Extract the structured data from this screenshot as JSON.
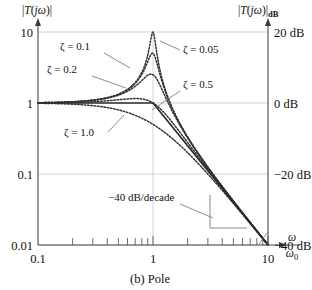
{
  "figure": {
    "caption": "(b) Pole",
    "left_axis_title": "|T(jω)|",
    "right_axis_title_main": "|T(jω)|",
    "right_axis_title_sub": "dB",
    "x_axis_title_num": "ω",
    "x_axis_title_den": "ω",
    "x_axis_title_den_sub": "0"
  },
  "chart_data": {
    "type": "line",
    "title": "(b) Pole",
    "xlabel": "ω/ω0",
    "ylabel": "|T(jω)|",
    "ylabel_right": "|T(jω)|dB",
    "xscale": "log",
    "yscale": "log",
    "xlim": [
      0.1,
      10
    ],
    "ylim": [
      0.01,
      10
    ],
    "grid": true,
    "legend_position": "inline-annotations",
    "x_ticks": [
      "0.1",
      "1",
      "10"
    ],
    "x_tick_values": [
      0.1,
      1,
      10
    ],
    "y_ticks_left": [
      "10",
      "1",
      "0.1",
      "0.01"
    ],
    "y_tick_values": [
      10,
      1,
      0.1,
      0.01
    ],
    "y_ticks_right": [
      "20 dB",
      "0 dB",
      "−20 dB",
      "−40 dB"
    ],
    "y_tick_values_right": [
      20,
      0,
      -20,
      -40
    ],
    "annotations": [
      {
        "text": "−40 dB/decade",
        "x": 1.9,
        "y": 0.055
      }
    ],
    "series": [
      {
        "name": "ζ = 0.05",
        "label": "ζ = 0.05",
        "zeta": 0.05,
        "style": "dotted",
        "peak_value": 10.0,
        "peak_x": 1.0
      },
      {
        "name": "ζ = 0.1",
        "label": "ζ = 0.1",
        "zeta": 0.1,
        "style": "dotted",
        "peak_value": 5.0,
        "peak_x": 1.0
      },
      {
        "name": "ζ = 0.2",
        "label": "ζ = 0.2",
        "zeta": 0.2,
        "style": "dotted",
        "peak_value": 2.55,
        "peak_x": 1.0
      },
      {
        "name": "ζ = 0.5",
        "label": "ζ = 0.5",
        "zeta": 0.5,
        "style": "dotted",
        "peak_value": 1.155,
        "peak_x": 0.707
      },
      {
        "name": "ζ = 1.0",
        "label": "ζ = 1.0",
        "zeta": 1.0,
        "style": "dotted",
        "peak_value": 1.0,
        "peak_x": 0.0
      },
      {
        "name": "asymptote",
        "label": "−40 dB/decade",
        "style": "solid",
        "points": [
          [
            0.1,
            1
          ],
          [
            1,
            1
          ],
          [
            10,
            0.01
          ]
        ]
      }
    ]
  }
}
